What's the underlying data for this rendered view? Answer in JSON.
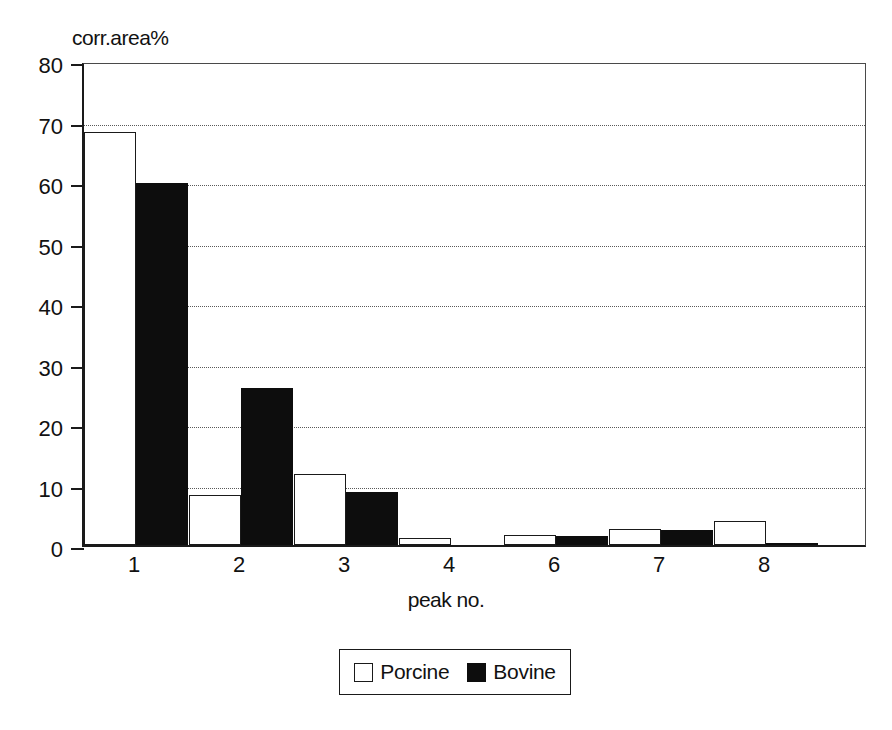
{
  "chart_data": {
    "type": "bar",
    "title": "",
    "ylabel": "corr.area%",
    "xlabel": "peak no.",
    "categories": [
      "1",
      "2",
      "3",
      "4",
      "6",
      "7",
      "8"
    ],
    "series": [
      {
        "name": "Porcine",
        "color": "#ffffff",
        "values": [
          68.2,
          8.3,
          11.8,
          1.2,
          1.6,
          2.7,
          4.0
        ]
      },
      {
        "name": "Bovine",
        "color": "#0d0d0d",
        "values": [
          59.8,
          26.0,
          8.8,
          0.0,
          1.5,
          2.4,
          0.3
        ]
      }
    ],
    "ylim": [
      0,
      80
    ],
    "yticks": [
      0,
      10,
      20,
      30,
      40,
      50,
      60,
      70,
      80
    ],
    "ytick_labels": [
      "0",
      "10",
      "20",
      "30",
      "40",
      "50",
      "60",
      "70",
      "80"
    ],
    "grid": "horizontal-dotted",
    "legend_position": "bottom-center",
    "legend_entries": [
      "Porcine",
      "Bovine"
    ]
  }
}
